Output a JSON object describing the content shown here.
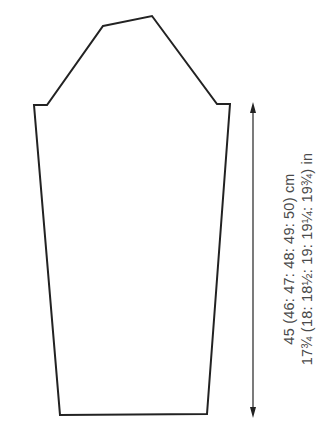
{
  "diagram": {
    "type": "sleeve-schematic",
    "outline_color": "#222222",
    "text_color": "#4a4a4a",
    "sleeve_outline_points": [
      [
        103,
        26
      ],
      [
        152,
        16
      ],
      [
        217,
        104
      ],
      [
        230,
        104
      ],
      [
        207,
        414
      ],
      [
        60,
        415
      ],
      [
        34,
        105
      ],
      [
        47,
        105
      ]
    ],
    "measurement_arrow": {
      "x": 253,
      "y_top": 102,
      "y_bottom": 418
    },
    "measurement": {
      "cm_label": "45 (46: 47: 48: 49: 50) cm",
      "in_label": "17¾ (18: 18½: 19: 19¼: 19¾) in"
    }
  }
}
